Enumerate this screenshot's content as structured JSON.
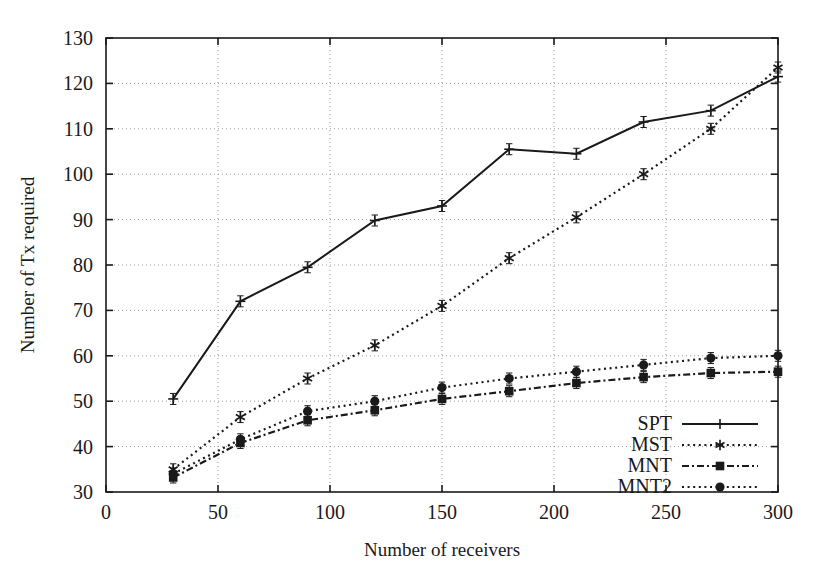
{
  "chart_data": {
    "type": "line",
    "title": "",
    "xlabel": "Number of receivers",
    "ylabel": "Number of Tx required",
    "xlim": [
      0,
      300
    ],
    "ylim": [
      30,
      130
    ],
    "xticks": [
      0,
      50,
      100,
      150,
      200,
      250,
      300
    ],
    "yticks": [
      30,
      40,
      50,
      60,
      70,
      80,
      90,
      100,
      110,
      120,
      130
    ],
    "grid": true,
    "legend_position": "lower-right",
    "x": [
      30,
      60,
      90,
      120,
      150,
      180,
      210,
      240,
      270,
      300
    ],
    "series": [
      {
        "name": "SPT",
        "marker": "plus",
        "linestyle": "solid",
        "color": "#1a1a1a",
        "values": [
          50.5,
          72.0,
          79.5,
          89.8,
          93.0,
          105.5,
          104.5,
          111.5,
          114.0,
          121.5
        ]
      },
      {
        "name": "MST",
        "marker": "star",
        "linestyle": "dotted",
        "color": "#1a1a1a",
        "values": [
          35.0,
          46.5,
          55.0,
          62.3,
          71.0,
          81.5,
          90.5,
          100.0,
          110.0,
          123.5
        ]
      },
      {
        "name": "MNT",
        "marker": "square",
        "linestyle": "dashdot",
        "color": "#1a1a1a",
        "values": [
          33.2,
          40.8,
          45.8,
          48.0,
          50.5,
          52.2,
          54.0,
          55.3,
          56.2,
          56.5
        ]
      },
      {
        "name": "MNT2",
        "marker": "circle",
        "linestyle": "dotted",
        "color": "#1a1a1a",
        "values": [
          34.0,
          41.6,
          47.8,
          50.0,
          53.0,
          55.0,
          56.5,
          58.0,
          59.5,
          60.0
        ]
      }
    ]
  },
  "legend": {
    "entries": [
      {
        "label": "SPT"
      },
      {
        "label": "MST"
      },
      {
        "label": "MNT"
      },
      {
        "label": "MNT2"
      }
    ]
  },
  "axis": {
    "x_title": "Number of receivers",
    "y_title": "Number of Tx required",
    "x_tick_labels": [
      "0",
      "50",
      "100",
      "150",
      "200",
      "250",
      "300"
    ],
    "y_tick_labels": [
      "30",
      "40",
      "50",
      "60",
      "70",
      "80",
      "90",
      "100",
      "110",
      "120",
      "130"
    ]
  },
  "colors": {
    "ink": "#1a1a1a",
    "grid": "#9a9a9a",
    "background": "#ffffff"
  }
}
